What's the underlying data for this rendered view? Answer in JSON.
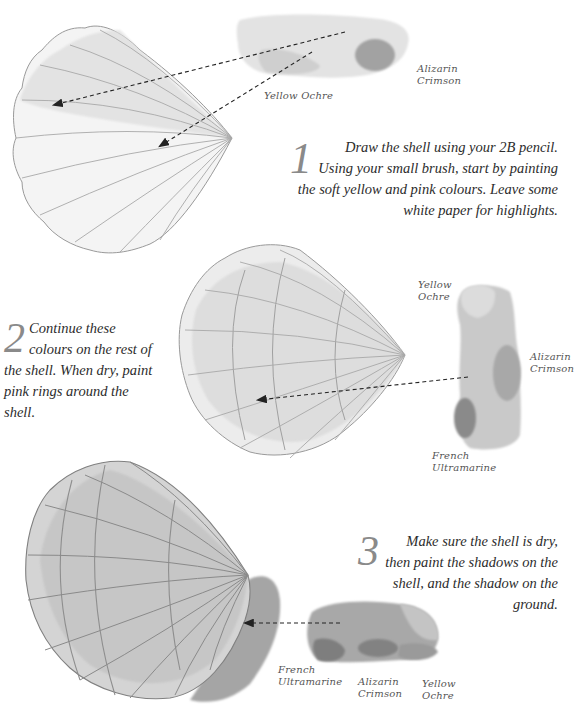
{
  "steps": [
    {
      "number": "1",
      "text": "Draw the shell using your 2B pencil. Using your small brush, start by painting the soft yellow and pink colours. Leave some white paper for highlights."
    },
    {
      "number": "2",
      "text": "Continue these colours on the rest of the shell. When dry, paint pink rings around the shell."
    },
    {
      "number": "3",
      "text": "Make sure the shell is dry, then paint the shadows on the shell, and the shadow on the ground."
    }
  ],
  "swatches": {
    "step1": {
      "labels": [
        "Alizarin Crimson",
        "Yellow Ochre"
      ]
    },
    "step2": {
      "labels": [
        "Yellow Ochre",
        "Alizarin Crimson",
        "French Ultramarine"
      ]
    },
    "step3": {
      "labels": [
        "French Ultramarine",
        "Alizarin Crimson",
        "Yellow Ochre"
      ]
    }
  },
  "labels": {
    "s1_alizarin_1": "Alizarin",
    "s1_alizarin_2": "Crimson",
    "s1_ochre": "Yellow Ochre",
    "s2_ochre_1": "Yellow",
    "s2_ochre_2": "Ochre",
    "s2_alizarin_1": "Alizarin",
    "s2_alizarin_2": "Crimson",
    "s2_french_1": "French",
    "s2_french_2": "Ultramarine",
    "s3_french_1": "French",
    "s3_french_2": "Ultramarine",
    "s3_alizarin_1": "Alizarin",
    "s3_alizarin_2": "Crimson",
    "s3_ochre_1": "Yellow",
    "s3_ochre_2": "Ochre"
  },
  "colors": {
    "ink": "#2c2c2c",
    "numeral": "#8a8a8a",
    "paint_light": "#d6d6d6",
    "paint_mid": "#b3b3b3",
    "paint_dark": "#8c8c8c"
  }
}
